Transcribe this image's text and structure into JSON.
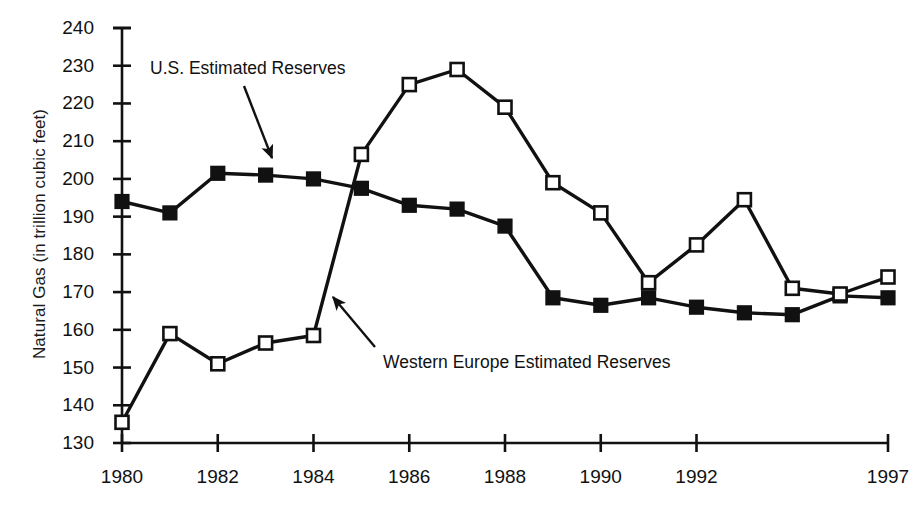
{
  "figure": {
    "width": 922,
    "height": 517,
    "background": "#ffffff",
    "ink": "#111111"
  },
  "chart_data": {
    "type": "line",
    "title": "",
    "xlabel": "",
    "ylabel": "Natural Gas (in trillion cubic feet)",
    "grid": false,
    "legend_position": "inline-annotations",
    "xlim": [
      1980,
      1996
    ],
    "ylim": [
      130,
      240
    ],
    "ytick_step": 10,
    "yticks": [
      130,
      140,
      150,
      160,
      170,
      180,
      190,
      200,
      210,
      220,
      230,
      240
    ],
    "ytick_labels": [
      "130",
      "140",
      "150",
      "160",
      "170",
      "180",
      "190",
      "200",
      "210",
      "220",
      "230",
      "240"
    ],
    "xticks": [
      1980,
      1982,
      1984,
      1986,
      1988,
      1990,
      1992,
      1996
    ],
    "xtick_labels": [
      "1980",
      "1982",
      "1984",
      "1986",
      "1988",
      "1990",
      "1992",
      "1997"
    ],
    "x": [
      1980,
      1981,
      1982,
      1983,
      1984,
      1985,
      1986,
      1987,
      1988,
      1989,
      1990,
      1991,
      1992,
      1993,
      1994,
      1995,
      1996
    ],
    "series": [
      {
        "name": "U.S. Estimated Reserves",
        "marker": "filled-square",
        "color": "#111111",
        "values": [
          194.0,
          191.0,
          201.5,
          201.0,
          200.0,
          197.5,
          193.0,
          192.0,
          187.5,
          168.5,
          166.5,
          168.5,
          166.0,
          164.5,
          164.0,
          169.0,
          168.5
        ]
      },
      {
        "name": "Western Europe Estimated Reserves",
        "marker": "open-square",
        "color": "#111111",
        "values": [
          135.5,
          159.0,
          151.0,
          156.5,
          158.5,
          206.5,
          225.0,
          229.0,
          219.0,
          199.0,
          191.0,
          172.5,
          182.5,
          194.5,
          171.0,
          169.5,
          174.0
        ]
      }
    ],
    "annotations": [
      {
        "text": "U.S. Estimated Reserves",
        "label_x": 150,
        "label_y": 58,
        "arrow_from": [
          244,
          86
        ],
        "arrow_to": [
          272,
          158
        ]
      },
      {
        "text": "Western Europe Estimated Reserves",
        "label_x": 383,
        "label_y": 352,
        "arrow_from": [
          375,
          347
        ],
        "arrow_to": [
          333,
          297
        ]
      }
    ]
  }
}
